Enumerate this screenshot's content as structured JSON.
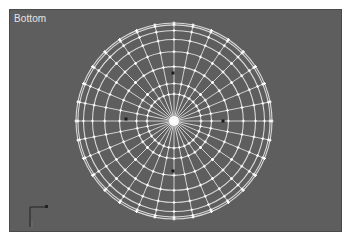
{
  "viewport": {
    "label": "Bottom",
    "background": "#5e5e5e",
    "wire_color": "#e6e6e6",
    "view": "bottom-orthographic"
  },
  "object": {
    "type": "sphere-wireframe",
    "center": [
      164,
      111
    ],
    "radius": 98,
    "segments": 32,
    "rings": 8,
    "inner_ring_radius": 27,
    "gizmo_markers": [
      [
        163,
        63
      ],
      [
        163,
        161
      ],
      [
        116,
        109
      ],
      [
        213,
        111
      ]
    ]
  },
  "axis_tripod": {
    "x_label": "x",
    "y_label": "y"
  }
}
